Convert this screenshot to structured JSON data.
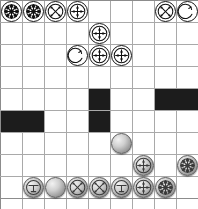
{
  "board": {
    "title": "grid-board",
    "columns": 9,
    "rows": 9,
    "cell_size": 22,
    "origin_x": 0,
    "origin_y": 0,
    "grid_line_color": "#a9a9a9",
    "background_color": "#ffffff",
    "blocked_color": "#1c1c1c",
    "white_piece_color": "#ffffff",
    "gray_piece_color": "#9a9a9a"
  },
  "blocked_cells": [
    {
      "col": 4,
      "row": 4
    },
    {
      "col": 7,
      "row": 4,
      "width": 2
    },
    {
      "col": 0,
      "row": 5,
      "width": 2
    },
    {
      "col": 4,
      "row": 5
    }
  ],
  "pieces": [
    {
      "id": "w1",
      "col": 0,
      "row": 0,
      "side": "white",
      "glyph": "burst-wheel"
    },
    {
      "id": "w2",
      "col": 1,
      "row": 0,
      "side": "white",
      "glyph": "burst-wheel"
    },
    {
      "id": "w3",
      "col": 2,
      "row": 0,
      "side": "white",
      "glyph": "x-cross-arrows"
    },
    {
      "id": "w4",
      "col": 3,
      "row": 0,
      "side": "white",
      "glyph": "plus-arrows"
    },
    {
      "id": "w5",
      "col": 7,
      "row": 0,
      "side": "white",
      "glyph": "x-cross-arrows"
    },
    {
      "id": "w6",
      "col": 8,
      "row": 0,
      "side": "white",
      "glyph": "hook-circle"
    },
    {
      "id": "w7",
      "col": 4,
      "row": 1,
      "side": "white",
      "glyph": "plus-arrows"
    },
    {
      "id": "w8",
      "col": 3,
      "row": 2,
      "side": "white",
      "glyph": "hook-circle"
    },
    {
      "id": "w9",
      "col": 4,
      "row": 2,
      "side": "white",
      "glyph": "plus-arrows"
    },
    {
      "id": "w10",
      "col": 5,
      "row": 2,
      "side": "white",
      "glyph": "plus-arrows"
    },
    {
      "id": "g1",
      "col": 5,
      "row": 6,
      "side": "gray",
      "glyph": "plain-sphere"
    },
    {
      "id": "g2",
      "col": 6,
      "row": 7,
      "side": "gray",
      "glyph": "plus-arrows"
    },
    {
      "id": "g3",
      "col": 8,
      "row": 7,
      "side": "gray",
      "glyph": "burst-wheel"
    },
    {
      "id": "g4",
      "col": 1,
      "row": 8,
      "side": "gray",
      "glyph": "t-mark"
    },
    {
      "id": "g5",
      "col": 2,
      "row": 8,
      "side": "gray",
      "glyph": "plain-sphere"
    },
    {
      "id": "g6",
      "col": 3,
      "row": 8,
      "side": "gray",
      "glyph": "x-cross-arrows"
    },
    {
      "id": "g7",
      "col": 4,
      "row": 8,
      "side": "gray",
      "glyph": "x-cross-arrows"
    },
    {
      "id": "g8",
      "col": 5,
      "row": 8,
      "side": "gray",
      "glyph": "t-mark"
    },
    {
      "id": "g9",
      "col": 6,
      "row": 8,
      "side": "gray",
      "glyph": "plus-arrows"
    },
    {
      "id": "g10",
      "col": 7,
      "row": 8,
      "side": "gray",
      "glyph": "burst-wheel"
    }
  ]
}
